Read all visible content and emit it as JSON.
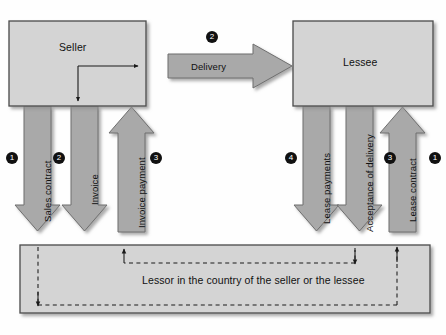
{
  "diagram": {
    "colors": {
      "box_fill": "#d4d4d4",
      "box_stroke": "#4a4a4a",
      "arrow_fill": "#a9a9a9",
      "arrow_stroke": "#6f6f6f",
      "line": "#1a1a1a",
      "marker_bg": "#111111",
      "marker_text": "#ffffff",
      "page_bg": "#ffffff"
    },
    "boxes": [
      {
        "id": "seller",
        "label": "Seller"
      },
      {
        "id": "lessee",
        "label": "Lessee"
      },
      {
        "id": "lessor",
        "label": "Lessor in the country of the seller or the lessee"
      }
    ],
    "flows": [
      {
        "id": "sales-contract",
        "label": "Sales contract",
        "marker": "1",
        "direction": "down",
        "side": "left"
      },
      {
        "id": "invoice",
        "label": "Invoice",
        "marker": "2",
        "direction": "down",
        "side": "left"
      },
      {
        "id": "invoice-payment",
        "label": "Invoice payment",
        "marker": "3",
        "direction": "up",
        "side": "left"
      },
      {
        "id": "delivery",
        "label": "Delivery",
        "marker": "2",
        "direction": "right",
        "side": "center"
      },
      {
        "id": "lease-payments",
        "label": "Lease payments",
        "marker": "4",
        "direction": "down",
        "side": "right"
      },
      {
        "id": "acceptance-of-delivery",
        "label": "Acceptance of delivery",
        "marker": "3",
        "direction": "down",
        "side": "right"
      },
      {
        "id": "lease-contract",
        "label": "Lease contract",
        "marker": "1",
        "direction": "up",
        "side": "right"
      }
    ],
    "markers": {
      "sales_contract": "1",
      "invoice": "2",
      "invoice_payment": "3",
      "delivery": "2",
      "lease_payments": "4",
      "acceptance_of_delivery": "3",
      "lease_contract": "1"
    }
  }
}
